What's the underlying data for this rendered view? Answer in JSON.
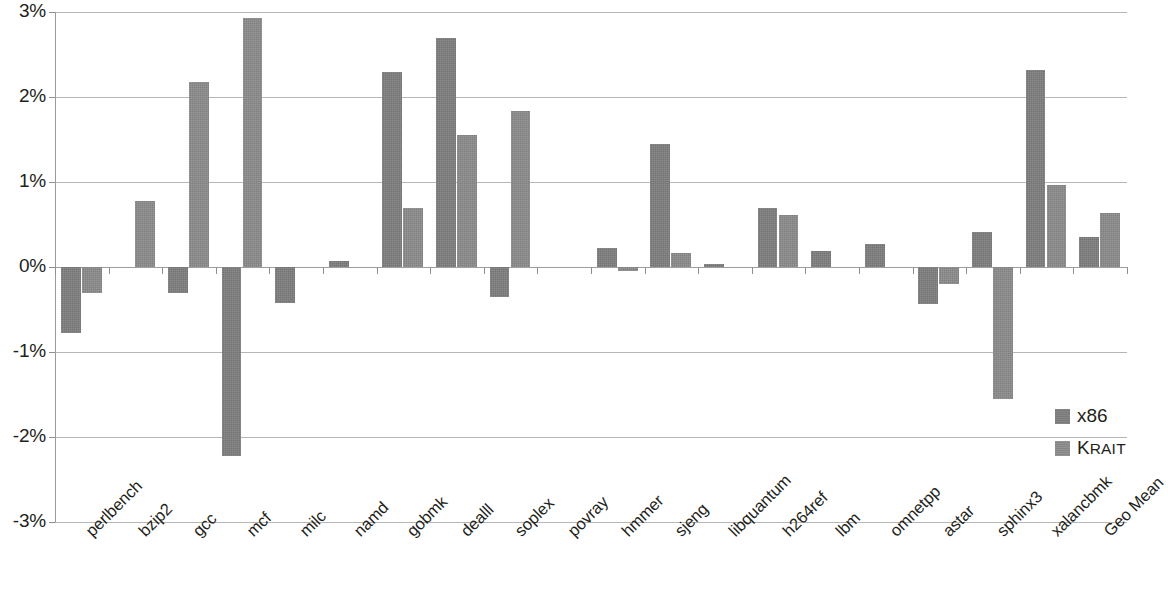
{
  "chart_data": {
    "type": "bar",
    "title": "",
    "subtitle": "",
    "xlabel": "",
    "ylabel": "",
    "ylim": [
      -3,
      3
    ],
    "ytick_labels": [
      "3%",
      "2%",
      "1%",
      "0%",
      "-1%",
      "-2%",
      "-3%"
    ],
    "yticks": [
      3,
      2,
      1,
      0,
      -1,
      -2,
      -3
    ],
    "grid": true,
    "legend_position": "right-middle",
    "value_format": "percent",
    "categories": [
      "perlbench",
      "bzip2",
      "gcc",
      "mcf",
      "milc",
      "namd",
      "gobmk",
      "dealll",
      "soplex",
      "povray",
      "hmmer",
      "sjeng",
      "libquantum",
      "h264ref",
      "lbm",
      "omnetpp",
      "astar",
      "sphinx3",
      "xalancbmk",
      "Geo Mean"
    ],
    "series": [
      {
        "name": "x86",
        "color": "#7f7f7f",
        "values": [
          -0.78,
          0.0,
          -0.3,
          -2.22,
          -0.42,
          0.07,
          2.3,
          2.7,
          -0.35,
          0.0,
          0.22,
          1.45,
          0.03,
          0.69,
          0.19,
          0.27,
          -0.43,
          0.41,
          2.32,
          0.35
        ]
      },
      {
        "name": "Krait",
        "color": "#8c8c8c",
        "values": [
          -0.3,
          0.78,
          2.18,
          2.93,
          0.0,
          0.0,
          0.69,
          1.55,
          1.84,
          0.0,
          -0.05,
          0.17,
          0.0,
          0.61,
          0.0,
          0.0,
          -0.2,
          -1.55,
          0.97,
          0.63
        ]
      }
    ]
  },
  "legend": {
    "entries": [
      {
        "label": "x86",
        "style": "normal"
      },
      {
        "label": "Krait",
        "style": "small-caps",
        "display_first": "K",
        "display_rest": "RAIT"
      }
    ]
  }
}
